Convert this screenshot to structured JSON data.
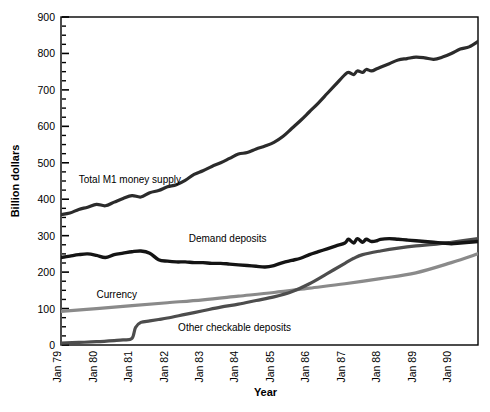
{
  "chart_data": {
    "type": "line",
    "title": "",
    "xlabel": "Year",
    "ylabel": "Billion dollars",
    "ylim": [
      0,
      900
    ],
    "ytick_step": 100,
    "yminor_step": 25,
    "grid": false,
    "legend_position": "inline-annotations",
    "ytick_labels": [
      "0",
      "100",
      "200",
      "300",
      "400",
      "500",
      "600",
      "700",
      "800",
      "900"
    ],
    "xtick_labels": [
      "Jan 79",
      "Jan 80",
      "Jan 81",
      "Jan 82",
      "Jan 83",
      "Jan 84",
      "Jan 85",
      "Jan 86",
      "Jan 87",
      "Jan 88",
      "Jan 89",
      "Jan 90"
    ],
    "x_start": 1979.0,
    "x_end": 1990.75,
    "series": [
      {
        "name": "Total M1 money supply",
        "color": "#2b2b2b",
        "width": 3.2,
        "label_x": 1979.5,
        "label_y": 452,
        "x": [
          1979.0,
          1979.25,
          1979.5,
          1979.75,
          1980.0,
          1980.25,
          1980.5,
          1980.75,
          1981.0,
          1981.25,
          1981.5,
          1981.75,
          1982.0,
          1982.25,
          1982.5,
          1982.75,
          1983.0,
          1983.25,
          1983.5,
          1983.75,
          1984.0,
          1984.25,
          1984.5,
          1984.75,
          1985.0,
          1985.25,
          1985.5,
          1985.75,
          1986.0,
          1986.25,
          1986.5,
          1986.75,
          1987.0,
          1987.1,
          1987.25,
          1987.35,
          1987.5,
          1987.6,
          1987.75,
          1987.9,
          1988.0,
          1988.25,
          1988.5,
          1988.75,
          1989.0,
          1989.25,
          1989.5,
          1989.75,
          1990.0,
          1990.25,
          1990.5,
          1990.75
        ],
        "y": [
          358,
          362,
          372,
          378,
          386,
          382,
          392,
          402,
          410,
          406,
          418,
          424,
          434,
          440,
          452,
          468,
          478,
          490,
          500,
          512,
          524,
          528,
          538,
          546,
          556,
          572,
          594,
          616,
          640,
          664,
          690,
          716,
          742,
          748,
          742,
          752,
          748,
          756,
          752,
          758,
          762,
          772,
          782,
          786,
          790,
          788,
          784,
          790,
          800,
          812,
          818,
          833
        ]
      },
      {
        "name": "Demand deposits",
        "color": "#141414",
        "width": 3.4,
        "label_x": 1982.6,
        "label_y": 292,
        "x": [
          1979.0,
          1979.25,
          1979.5,
          1979.75,
          1980.0,
          1980.25,
          1980.5,
          1980.75,
          1981.0,
          1981.25,
          1981.5,
          1981.75,
          1982.0,
          1982.25,
          1982.5,
          1982.75,
          1983.0,
          1983.25,
          1983.5,
          1983.75,
          1984.0,
          1984.25,
          1984.5,
          1984.75,
          1985.0,
          1985.25,
          1985.5,
          1985.75,
          1986.0,
          1986.25,
          1986.5,
          1986.75,
          1987.0,
          1987.1,
          1987.25,
          1987.35,
          1987.5,
          1987.6,
          1987.75,
          1987.9,
          1988.0,
          1988.25,
          1988.5,
          1988.75,
          1989.0,
          1989.25,
          1989.5,
          1989.75,
          1990.0,
          1990.25,
          1990.5,
          1990.75
        ],
        "y": [
          240,
          244,
          248,
          250,
          246,
          240,
          248,
          252,
          256,
          258,
          252,
          234,
          230,
          228,
          228,
          226,
          226,
          224,
          224,
          222,
          220,
          218,
          216,
          214,
          218,
          226,
          232,
          238,
          248,
          256,
          264,
          272,
          280,
          290,
          280,
          292,
          282,
          290,
          284,
          286,
          290,
          292,
          290,
          288,
          286,
          284,
          282,
          280,
          278,
          280,
          282,
          284
        ]
      },
      {
        "name": "Other checkable deposits",
        "color": "#4d4d4d",
        "width": 3.2,
        "label_x": 1982.3,
        "label_y": 46,
        "x": [
          1979.0,
          1979.5,
          1980.0,
          1980.5,
          1980.75,
          1981.0,
          1981.1,
          1981.25,
          1981.5,
          1981.75,
          1982.0,
          1982.5,
          1983.0,
          1983.5,
          1984.0,
          1984.5,
          1985.0,
          1985.5,
          1986.0,
          1986.5,
          1987.0,
          1987.25,
          1987.5,
          1988.0,
          1988.5,
          1989.0,
          1989.5,
          1990.0,
          1990.75
        ],
        "y": [
          5,
          7,
          9,
          12,
          14,
          18,
          48,
          62,
          66,
          70,
          74,
          84,
          94,
          104,
          112,
          122,
          132,
          146,
          168,
          196,
          224,
          238,
          248,
          258,
          266,
          272,
          276,
          282,
          292
        ]
      },
      {
        "name": "Currency",
        "color": "#8a8a8a",
        "width": 3.2,
        "label_x": 1980.0,
        "label_y": 138,
        "x": [
          1979.0,
          1980.0,
          1981.0,
          1982.0,
          1983.0,
          1984.0,
          1985.0,
          1986.0,
          1987.0,
          1988.0,
          1989.0,
          1990.0,
          1990.75
        ],
        "y": [
          92,
          100,
          108,
          116,
          124,
          134,
          144,
          156,
          168,
          182,
          198,
          226,
          250
        ]
      }
    ]
  }
}
